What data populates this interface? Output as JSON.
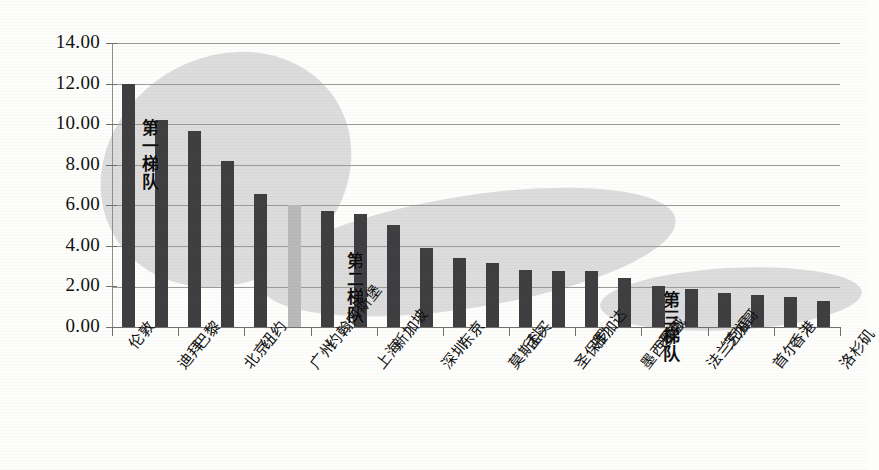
{
  "chart_data": {
    "type": "bar",
    "title": "",
    "subtitle": "",
    "xlabel": "",
    "ylabel": "",
    "ylim": [
      0,
      14
    ],
    "ytick_step": 2,
    "ytick_labels": [
      "0.00",
      "2.00",
      "4.00",
      "6.00",
      "8.00",
      "10.00",
      "12.00",
      "14.00"
    ],
    "grid": true,
    "legend": "none",
    "categories": [
      "伦敦",
      "迪拜",
      "巴黎",
      "北京",
      "纽约",
      "广州",
      "约翰内斯堡",
      "上海",
      "新加坡",
      "深圳",
      "东京",
      "莫斯科",
      "孟买",
      "圣保罗",
      "雅加达",
      "墨西哥城",
      "悉尼",
      "法兰克福",
      "芝加哥",
      "首尔",
      "香港",
      "洛杉矶"
    ],
    "values": [
      12.0,
      10.2,
      9.65,
      8.2,
      6.55,
      6.0,
      5.7,
      5.55,
      5.05,
      3.9,
      3.4,
      3.15,
      2.8,
      2.75,
      2.75,
      2.4,
      2.0,
      1.85,
      1.7,
      1.6,
      1.5,
      1.3
    ],
    "bar_colors": [
      "dark",
      "dark",
      "dark",
      "dark",
      "dark",
      "light",
      "dark",
      "dark",
      "dark",
      "dark",
      "dark",
      "dark",
      "dark",
      "dark",
      "dark",
      "dark",
      "dark",
      "dark",
      "dark",
      "dark",
      "dark",
      "dark"
    ],
    "annotations": [
      {
        "text": "第一梯队",
        "x_index": 1,
        "value": 9.0
      },
      {
        "text": "第二梯队",
        "x_index": 7,
        "value": 3.6
      },
      {
        "text": "第三梯队",
        "x_index": 17,
        "value": 1.4
      }
    ],
    "highlight_regions": [
      {
        "label": "第一梯队",
        "shape": "ellipse"
      },
      {
        "label": "第二梯队",
        "shape": "ellipse"
      },
      {
        "label": "第三梯队",
        "shape": "ellipse"
      }
    ],
    "colors": {
      "bar_dark": "#3f3f42",
      "bar_light": "#b9b9b9",
      "ellipse": "#dcdcdc",
      "gridline": "#9a9a97",
      "axis": "#6f6f6d",
      "background": "#fdfdfb",
      "text": "#111111"
    }
  }
}
